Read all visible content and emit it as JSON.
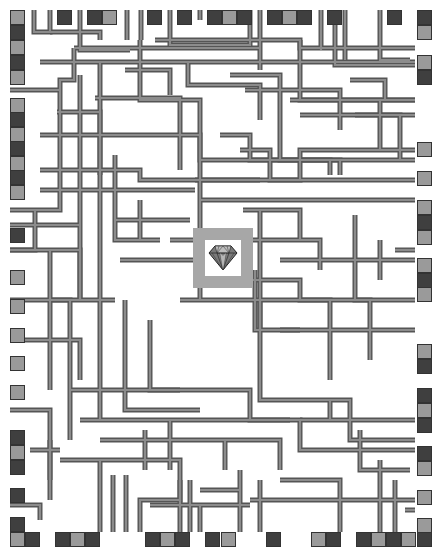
{
  "game": {
    "type": "pipe-maze",
    "goal": {
      "icon": "diamond-icon",
      "frame": [
        193,
        228,
        60,
        60
      ],
      "inner": [
        205,
        240,
        36,
        36
      ]
    }
  },
  "colors": {
    "background": "#ffffff",
    "pipe_outline": "#555555",
    "pipe_fill": "#8c8c8c",
    "tile_dark": "#3f3f3f",
    "tile_light": "#9a9a9a",
    "goal_frame": "#a7a7a7"
  },
  "tiles": {
    "top": [
      {
        "x": 10,
        "y": 10,
        "c": "light"
      },
      {
        "x": 57,
        "y": 10,
        "c": "dark"
      },
      {
        "x": 87,
        "y": 10,
        "c": "dark"
      },
      {
        "x": 102,
        "y": 10,
        "c": "light"
      },
      {
        "x": 147,
        "y": 10,
        "c": "dark"
      },
      {
        "x": 177,
        "y": 10,
        "c": "dark"
      },
      {
        "x": 207,
        "y": 10,
        "c": "dark"
      },
      {
        "x": 222,
        "y": 10,
        "c": "light"
      },
      {
        "x": 237,
        "y": 10,
        "c": "dark"
      },
      {
        "x": 267,
        "y": 10,
        "c": "dark"
      },
      {
        "x": 282,
        "y": 10,
        "c": "light"
      },
      {
        "x": 297,
        "y": 10,
        "c": "dark"
      },
      {
        "x": 327,
        "y": 10,
        "c": "dark"
      },
      {
        "x": 387,
        "y": 10,
        "c": "dark"
      },
      {
        "x": 417,
        "y": 10,
        "c": "dark"
      }
    ],
    "left": [
      {
        "x": 10,
        "y": 25,
        "c": "dark"
      },
      {
        "x": 10,
        "y": 40,
        "c": "light"
      },
      {
        "x": 10,
        "y": 55,
        "c": "dark"
      },
      {
        "x": 10,
        "y": 70,
        "c": "light"
      },
      {
        "x": 10,
        "y": 98,
        "c": "light"
      },
      {
        "x": 10,
        "y": 112,
        "c": "dark"
      },
      {
        "x": 10,
        "y": 127,
        "c": "light"
      },
      {
        "x": 10,
        "y": 141,
        "c": "dark"
      },
      {
        "x": 10,
        "y": 156,
        "c": "light"
      },
      {
        "x": 10,
        "y": 170,
        "c": "dark"
      },
      {
        "x": 10,
        "y": 185,
        "c": "light"
      },
      {
        "x": 10,
        "y": 228,
        "c": "dark"
      },
      {
        "x": 10,
        "y": 270,
        "c": "light"
      },
      {
        "x": 10,
        "y": 299,
        "c": "light"
      },
      {
        "x": 10,
        "y": 328,
        "c": "light"
      },
      {
        "x": 10,
        "y": 356,
        "c": "light"
      },
      {
        "x": 10,
        "y": 385,
        "c": "light"
      },
      {
        "x": 10,
        "y": 430,
        "c": "dark"
      },
      {
        "x": 10,
        "y": 445,
        "c": "light"
      },
      {
        "x": 10,
        "y": 460,
        "c": "dark"
      },
      {
        "x": 10,
        "y": 488,
        "c": "dark"
      },
      {
        "x": 10,
        "y": 517,
        "c": "dark"
      }
    ],
    "right": [
      {
        "x": 417,
        "y": 25,
        "c": "light"
      },
      {
        "x": 417,
        "y": 55,
        "c": "light"
      },
      {
        "x": 417,
        "y": 70,
        "c": "dark"
      },
      {
        "x": 417,
        "y": 142,
        "c": "light"
      },
      {
        "x": 417,
        "y": 171,
        "c": "light"
      },
      {
        "x": 417,
        "y": 200,
        "c": "light"
      },
      {
        "x": 417,
        "y": 215,
        "c": "dark"
      },
      {
        "x": 417,
        "y": 230,
        "c": "light"
      },
      {
        "x": 417,
        "y": 258,
        "c": "light"
      },
      {
        "x": 417,
        "y": 273,
        "c": "dark"
      },
      {
        "x": 417,
        "y": 287,
        "c": "light"
      },
      {
        "x": 417,
        "y": 344,
        "c": "light"
      },
      {
        "x": 417,
        "y": 359,
        "c": "dark"
      },
      {
        "x": 417,
        "y": 388,
        "c": "dark"
      },
      {
        "x": 417,
        "y": 403,
        "c": "light"
      },
      {
        "x": 417,
        "y": 418,
        "c": "dark"
      },
      {
        "x": 417,
        "y": 446,
        "c": "dark"
      },
      {
        "x": 417,
        "y": 461,
        "c": "light"
      },
      {
        "x": 417,
        "y": 490,
        "c": "light"
      },
      {
        "x": 417,
        "y": 518,
        "c": "light"
      }
    ],
    "bottom": [
      {
        "x": 10,
        "y": 532,
        "c": "light"
      },
      {
        "x": 25,
        "y": 532,
        "c": "dark"
      },
      {
        "x": 55,
        "y": 532,
        "c": "dark"
      },
      {
        "x": 70,
        "y": 532,
        "c": "light"
      },
      {
        "x": 85,
        "y": 532,
        "c": "dark"
      },
      {
        "x": 145,
        "y": 532,
        "c": "dark"
      },
      {
        "x": 160,
        "y": 532,
        "c": "light"
      },
      {
        "x": 175,
        "y": 532,
        "c": "dark"
      },
      {
        "x": 205,
        "y": 532,
        "c": "dark"
      },
      {
        "x": 221,
        "y": 532,
        "c": "light"
      },
      {
        "x": 266,
        "y": 532,
        "c": "dark"
      },
      {
        "x": 311,
        "y": 532,
        "c": "light"
      },
      {
        "x": 326,
        "y": 532,
        "c": "dark"
      },
      {
        "x": 356,
        "y": 532,
        "c": "dark"
      },
      {
        "x": 371,
        "y": 532,
        "c": "light"
      },
      {
        "x": 386,
        "y": 532,
        "c": "dark"
      },
      {
        "x": 401,
        "y": 532,
        "c": "light"
      },
      {
        "x": 417,
        "y": 532,
        "c": "dark"
      }
    ]
  },
  "pipes": [
    "M34 10 V32 H50 V10",
    "M50 32 H100 V40",
    "M80 10 V50 H130",
    "M127 10 V40",
    "M141 10 V40",
    "M170 10 V45 H250 V10",
    "M200 10 V20",
    "M260 10 V70",
    "M321 10 V50",
    "M335 10 V65 H415",
    "M345 10 V60",
    "M380 10 V60 H410",
    "M155 40 H300 V48 H415",
    "M74 48 H260",
    "M74 48 V80 H60 V180",
    "M40 62 H415",
    "M140 40 V100 H200 V300",
    "M100 62 V420",
    "M10 90 H60",
    "M57 112 H100 V175",
    "M80 75 V300",
    "M95 98 H180 V170",
    "M125 70 H170 V95",
    "M188 62 V85 H260 V120",
    "M230 75 H280 V160 H340 V175",
    "M245 90 H340 V130",
    "M300 40 V100 H380 V150",
    "M350 80 H385 V100 H415",
    "M355 115 H400 V160",
    "M290 100 H415",
    "M300 115 H415",
    "M40 135 H200 V160 H415",
    "M40 170 H140 V180 H260",
    "M115 155 V240 H160",
    "M60 180 V210 H10",
    "M35 210 V250 H10",
    "M220 135 H250 V160 H330 V175",
    "M240 150 H270 V180 H415",
    "M195 180 H300 V150 H415",
    "M200 200 H415",
    "M243 210 H300 V240",
    "M280 260 H415",
    "M260 210 V330",
    "M10 225 H80",
    "M10 250 H80 V300",
    "M50 250 V390",
    "M50 300 H115",
    "M10 300 H70 V440",
    "M10 340 H80 V380",
    "M70 390 H180",
    "M125 300 V410 H200",
    "M250 240 H320 V270",
    "M230 280 H300 V300 H370 V360",
    "M260 300 V400 H350 V440 H415",
    "M180 300 H330 V380",
    "M280 330 H415",
    "M150 320 V390 H250 V420 H290",
    "M80 420 H300 V450 H415",
    "M100 440 H280 V470",
    "M10 410 H50 V500",
    "M60 460 H180 V500 H140 V532",
    "M100 460 V532",
    "M113 475 V532",
    "M126 475 V532",
    "M180 480 V532",
    "M190 480 V532",
    "M200 505 V532",
    "M240 470 V532",
    "M250 500 H415",
    "M260 480 V532",
    "M280 480 H340 V532",
    "M200 490 H240",
    "M150 505 H250",
    "M380 460 V532",
    "M395 480 V532",
    "M405 510 H415",
    "M10 505 H40 V520",
    "M30 450 H60",
    "M50 440 V480",
    "M300 420 H415",
    "M330 400 V420",
    "M360 430 V470 H410",
    "M140 200 V240",
    "M170 240 H195",
    "M120 260 H195",
    "M40 190 H195",
    "M115 220 H190",
    "M255 270 V330 H300",
    "M355 215 V300 H415",
    "M380 240 V280",
    "M395 250 H415",
    "M170 420 V470",
    "M145 430 V470",
    "M225 440 V470"
  ]
}
